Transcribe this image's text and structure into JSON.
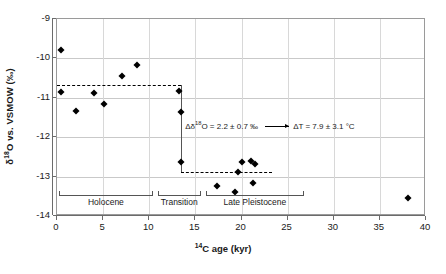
{
  "chart_data": {
    "type": "scatter",
    "title": "",
    "xlabel": "14C age (kyr)",
    "xlabel_parts": {
      "sup": "14",
      "rest": "C age (kyr)"
    },
    "ylabel": "d18O vs. VSMOW (‰)",
    "ylabel_parts": {
      "lead": "δ",
      "sup": "18",
      "rest": "O vs. VSMOW (‰)"
    },
    "xlim": [
      0,
      40
    ],
    "ylim": [
      -14,
      -9
    ],
    "xticks": [
      0,
      5,
      10,
      15,
      20,
      25,
      30,
      35,
      40
    ],
    "yticks": [
      -9,
      -10,
      -11,
      -12,
      -13,
      -14
    ],
    "grid": "horizontal-and-vertical",
    "legend": "none",
    "series": [
      {
        "name": "d18O measurements",
        "marker": "filled-diamond",
        "points": [
          {
            "x": 0.4,
            "y": -9.78
          },
          {
            "x": 0.4,
            "y": -10.86
          },
          {
            "x": 2.1,
            "y": -11.33
          },
          {
            "x": 4.0,
            "y": -10.88
          },
          {
            "x": 5.1,
            "y": -11.15
          },
          {
            "x": 7.0,
            "y": -10.45
          },
          {
            "x": 8.7,
            "y": -10.18
          },
          {
            "x": 13.2,
            "y": -10.83
          },
          {
            "x": 13.4,
            "y": -11.35
          },
          {
            "x": 13.4,
            "y": -12.62
          },
          {
            "x": 17.3,
            "y": -13.25
          },
          {
            "x": 19.3,
            "y": -13.38
          },
          {
            "x": 19.6,
            "y": -12.88
          },
          {
            "x": 20.1,
            "y": -12.62
          },
          {
            "x": 21.0,
            "y": -12.6
          },
          {
            "x": 21.3,
            "y": -13.15
          },
          {
            "x": 21.5,
            "y": -12.68
          },
          {
            "x": 38.1,
            "y": -13.55
          }
        ]
      }
    ],
    "reference_lines": [
      {
        "name": "holocene-mean",
        "style": "dashed",
        "y": -10.68,
        "x_start": 0.0,
        "x_end": 13.4
      },
      {
        "name": "pleistocene-mean",
        "style": "dashed",
        "y": -12.88,
        "x_start": 13.4,
        "x_end": 23.3
      }
    ],
    "connectors": [
      {
        "name": "delta-connector",
        "x": 13.4,
        "y_start": -10.68,
        "y_end": -12.88
      }
    ],
    "periods": [
      {
        "name": "holocene",
        "label": "Holocene",
        "x_start": 0.2,
        "x_end": 10.4
      },
      {
        "name": "transition",
        "label": "Transition",
        "x_start": 10.9,
        "x_end": 15.6
      },
      {
        "name": "late-pleistocene",
        "label": "Late Pleistocene",
        "x_start": 16.1,
        "x_end": 26.8
      }
    ],
    "period_bracket_y": -13.5,
    "annotations": [
      {
        "name": "delta-d18o-annotation",
        "text": "Δδ18O = 2.2 ± 0.7 ‰",
        "parts": {
          "lead": "Δδ",
          "sup": "18",
          "rest": "O = 2.2 ± 0.7 ‰"
        },
        "x": 13.9,
        "y": -11.75
      },
      {
        "name": "delta-t-annotation",
        "text": "ΔT = 7.9 ± 3.1 °C",
        "parts": {
          "lead": "",
          "sup": "",
          "rest": "ΔT = 7.9 ± 3.1 °C"
        },
        "x": 25.6,
        "y": -11.75
      }
    ],
    "arrow": {
      "name": "delta-t-arrow",
      "x_start": 22.5,
      "x_end": 25.2,
      "y": -11.75
    }
  },
  "colors": {
    "marker": "#000000",
    "frame": "#9a9a9a",
    "axis": "#6b6b6b",
    "gridline": "#c9c9c9",
    "bracket": "#555555",
    "background": "#ffffff"
  }
}
